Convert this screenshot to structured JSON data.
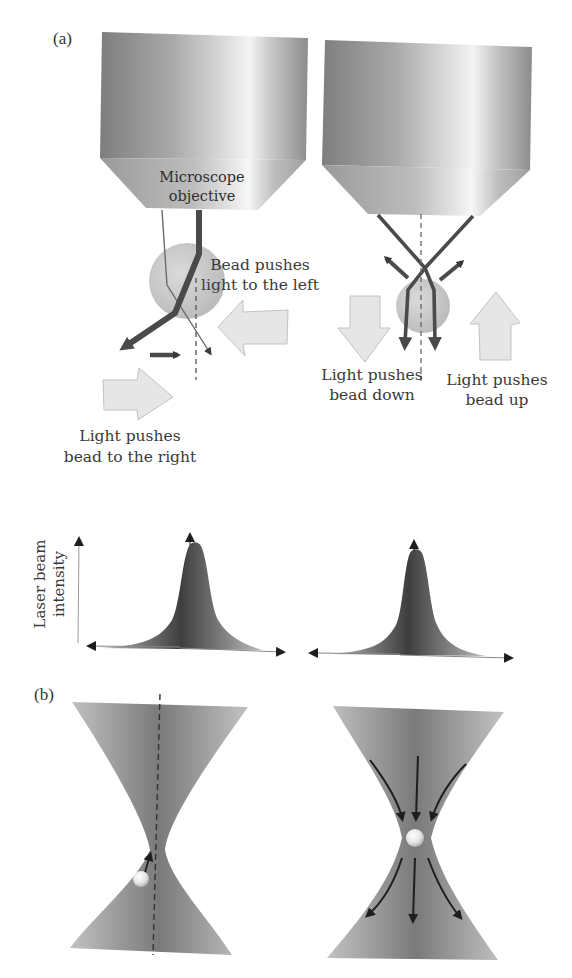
{
  "panel_a": {
    "label": "(a)",
    "objective_label_line1": "Microscope",
    "objective_label_line2": "objective",
    "left": {
      "bead_pushes_light_line1": "Bead pushes",
      "bead_pushes_light_line2": "light to the left",
      "light_pushes_bead_line1": "Light pushes",
      "light_pushes_bead_line2": "bead to the right"
    },
    "right": {
      "down_label_line1": "Light pushes",
      "down_label_line2": "bead down",
      "up_label_line1": "Light pushes",
      "up_label_line2": "bead up"
    },
    "intensity_axis_line1": "Laser beam",
    "intensity_axis_line2": "intensity"
  },
  "panel_b": {
    "label": "(b)"
  },
  "colors": {
    "objective_dark": "#8a8a8a",
    "objective_light": "#f2f2f2",
    "beam": "#4a4a4a",
    "bead": "#c4c4c4",
    "force_arrow_fill": "#e6e6e6",
    "force_arrow_stroke": "#b5b5b5",
    "gaussian": "#555555",
    "beam_cone": "#8e8e8e"
  }
}
